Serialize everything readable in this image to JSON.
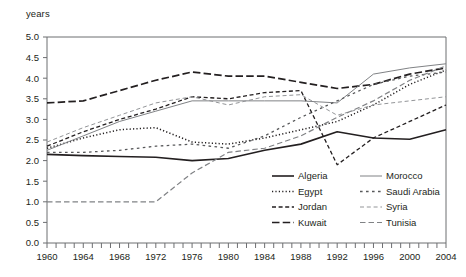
{
  "axis": {
    "y_label": "years",
    "y_ticks": [
      "0.0",
      "0.5",
      "1.0",
      "1.5",
      "2.0",
      "2.5",
      "3.0",
      "3.5",
      "4.0",
      "4.5",
      "5.0"
    ],
    "x_ticks": [
      "1960",
      "1964",
      "1968",
      "1972",
      "1976",
      "1980",
      "1984",
      "1988",
      "1992",
      "1996",
      "2000",
      "2004"
    ]
  },
  "legend": {
    "items": [
      {
        "label": "Algeria",
        "style": "solid-thick"
      },
      {
        "label": "Morocco",
        "style": "solid-thin"
      },
      {
        "label": "Egypt",
        "style": "dotted"
      },
      {
        "label": "Saudi Arabia",
        "style": "dash-spaced"
      },
      {
        "label": "Jordan",
        "style": "dash-short"
      },
      {
        "label": "Syria",
        "style": "dash-thin"
      },
      {
        "label": "Kuwait",
        "style": "dash-long"
      },
      {
        "label": "Tunisia",
        "style": "dash-medium"
      }
    ]
  },
  "chart_data": {
    "type": "line",
    "title": "",
    "xlabel": "",
    "ylabel": "years",
    "xlim": [
      1960,
      2004
    ],
    "ylim": [
      0.0,
      5.0
    ],
    "grid": false,
    "legend_position": "inside-bottom-right",
    "x": [
      1960,
      1964,
      1968,
      1972,
      1976,
      1980,
      1984,
      1988,
      1992,
      1996,
      2000,
      2004
    ],
    "series": [
      {
        "name": "Algeria",
        "color": "#231f20",
        "style": "solid-thick",
        "values": [
          2.15,
          2.12,
          2.1,
          2.08,
          2.0,
          2.05,
          2.25,
          2.4,
          2.7,
          2.55,
          2.52,
          2.75
        ]
      },
      {
        "name": "Egypt",
        "color": "#231f20",
        "style": "dotted",
        "values": [
          2.3,
          2.55,
          2.75,
          2.8,
          2.45,
          2.4,
          2.55,
          2.75,
          2.95,
          3.35,
          3.85,
          4.2
        ]
      },
      {
        "name": "Jordan",
        "color": "#231f20",
        "style": "dash-short",
        "values": [
          2.35,
          2.7,
          3.0,
          3.25,
          3.55,
          3.5,
          3.65,
          3.7,
          1.9,
          2.55,
          2.95,
          3.35
        ]
      },
      {
        "name": "Kuwait",
        "color": "#231f20",
        "style": "dash-long",
        "values": [
          3.4,
          3.45,
          3.7,
          3.95,
          4.15,
          4.05,
          4.05,
          3.9,
          3.75,
          3.85,
          4.1,
          4.25
        ]
      },
      {
        "name": "Morocco",
        "color": "#808285",
        "style": "solid-thin",
        "values": [
          2.25,
          2.6,
          2.95,
          3.2,
          3.45,
          3.45,
          3.45,
          3.45,
          3.4,
          4.1,
          4.25,
          4.35
        ]
      },
      {
        "name": "Saudi Arabia",
        "color": "#58595b",
        "style": "dash-spaced",
        "values": [
          2.2,
          2.2,
          2.25,
          2.35,
          2.4,
          2.3,
          2.6,
          3.05,
          3.45,
          3.85,
          4.05,
          4.15
        ]
      },
      {
        "name": "Syria",
        "color": "#939598",
        "style": "dash-thin",
        "values": [
          2.45,
          2.8,
          3.1,
          3.4,
          3.55,
          3.35,
          3.55,
          3.6,
          3.1,
          3.35,
          3.45,
          3.55
        ]
      },
      {
        "name": "Tunisia",
        "color": "#808285",
        "style": "dash-medium",
        "values": [
          1.0,
          1.0,
          1.0,
          1.0,
          1.7,
          2.2,
          2.3,
          2.6,
          3.05,
          3.45,
          3.95,
          4.3
        ]
      }
    ]
  }
}
